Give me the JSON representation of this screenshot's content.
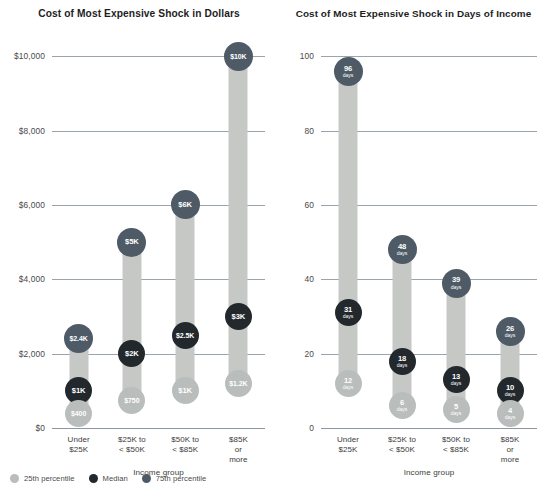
{
  "legend": {
    "items": [
      {
        "label": "25th percentile",
        "color": "#b9bdbb",
        "key": "p25"
      },
      {
        "label": "Median",
        "color": "#23282d",
        "key": "med"
      },
      {
        "label": "75th percentile",
        "color": "#4e5b66",
        "key": "p75"
      }
    ]
  },
  "chart_data": [
    {
      "type": "bar",
      "id": "dollars",
      "title": "Cost of Most Expensive Shock in Dollars",
      "xlabel": "Income group",
      "ylabel": "",
      "ylim": [
        0,
        10600
      ],
      "grid": true,
      "legend_position": "bottom-left",
      "categories": [
        "Under\n$25K",
        "$25K to\n< $50K",
        "$50K to\n< $85K",
        "$85K\nor more"
      ],
      "yticks": [
        {
          "value": 0,
          "label": "$0"
        },
        {
          "value": 2000,
          "label": "$2,000"
        },
        {
          "value": 4000,
          "label": "$4,000"
        },
        {
          "value": 6000,
          "label": "$6,000"
        },
        {
          "value": 8000,
          "label": "$8,000"
        },
        {
          "value": 10000,
          "label": "$10,000"
        }
      ],
      "series": [
        {
          "name": "25th percentile",
          "key": "p25",
          "values": [
            400,
            750,
            1000,
            1200
          ],
          "labels": [
            "$400",
            "$750",
            "$1K",
            "$1.2K"
          ]
        },
        {
          "name": "Median",
          "key": "med",
          "values": [
            1000,
            2000,
            2500,
            3000
          ],
          "labels": [
            "$1K",
            "$2K",
            "$2.5K",
            "$3K"
          ]
        },
        {
          "name": "75th percentile",
          "key": "p75",
          "values": [
            2400,
            5000,
            6000,
            10000
          ],
          "labels": [
            "$2.4K",
            "$5K",
            "$6K",
            "$10K"
          ]
        }
      ]
    },
    {
      "type": "bar",
      "id": "days",
      "title": "Cost of Most Expensive Shock in Days of Income",
      "xlabel": "Income group",
      "ylabel": "",
      "ylim": [
        0,
        106
      ],
      "grid": true,
      "legend_position": "bottom-left",
      "categories": [
        "Under\n$25K",
        "$25K to\n< $50K",
        "$50K to\n< $85K",
        "$85K\nor more"
      ],
      "yticks": [
        {
          "value": 0,
          "label": "0"
        },
        {
          "value": 20,
          "label": "20"
        },
        {
          "value": 40,
          "label": "40"
        },
        {
          "value": 60,
          "label": "60"
        },
        {
          "value": 80,
          "label": "80"
        },
        {
          "value": 100,
          "label": "100"
        }
      ],
      "series": [
        {
          "name": "25th percentile",
          "key": "p25",
          "values": [
            12,
            6,
            5,
            4
          ],
          "labels": [
            "12",
            "6",
            "5",
            "4"
          ],
          "unit": "days"
        },
        {
          "name": "Median",
          "key": "med",
          "values": [
            31,
            18,
            13,
            10
          ],
          "labels": [
            "31",
            "18",
            "13",
            "10"
          ],
          "unit": "days"
        },
        {
          "name": "75th percentile",
          "key": "p75",
          "values": [
            96,
            48,
            39,
            26
          ],
          "labels": [
            "96",
            "48",
            "39",
            "26"
          ],
          "unit": "days"
        }
      ]
    }
  ]
}
